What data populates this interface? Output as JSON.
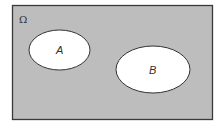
{
  "diagram": {
    "type": "venn",
    "universe": {
      "label": "Ω",
      "fill": "#bdbdbd",
      "stroke": "#3a3a3a"
    },
    "sets": [
      {
        "label": "A",
        "fill": "#ffffff",
        "stroke": "#333333"
      },
      {
        "label": "B",
        "fill": "#ffffff",
        "stroke": "#333333"
      }
    ],
    "relationship": "disjoint"
  }
}
